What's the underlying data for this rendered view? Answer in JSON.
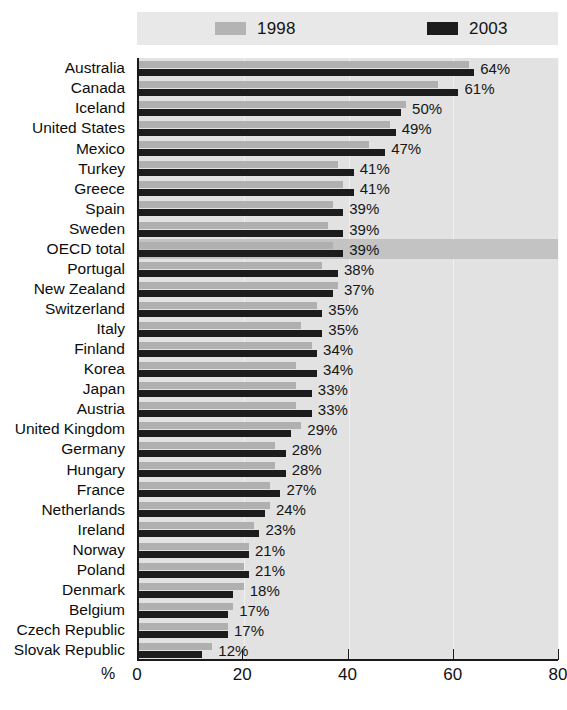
{
  "legend": {
    "entries": [
      {
        "label": "1998",
        "color": "#b0b0b0",
        "swatch": "gray"
      },
      {
        "label": "2003",
        "color": "#1c1c1c",
        "swatch": "black"
      }
    ]
  },
  "axis": {
    "unit": "%",
    "ticks": [
      "0",
      "20",
      "40",
      "60",
      "80"
    ],
    "min": 0,
    "max": 80
  },
  "chart_data": {
    "type": "bar",
    "orientation": "horizontal",
    "title": "",
    "subtitle": "",
    "xlabel": "%",
    "ylabel": "",
    "xlim": [
      0,
      80
    ],
    "grid": true,
    "legend_position": "top",
    "highlight_category": "OECD total",
    "categories": [
      "Australia",
      "Canada",
      "Iceland",
      "United States",
      "Mexico",
      "Turkey",
      "Greece",
      "Spain",
      "Sweden",
      "OECD total",
      "Portugal",
      "New Zealand",
      "Switzerland",
      "Italy",
      "Finland",
      "Korea",
      "Japan",
      "Austria",
      "United Kingdom",
      "Germany",
      "Hungary",
      "France",
      "Netherlands",
      "Ireland",
      "Norway",
      "Poland",
      "Denmark",
      "Belgium",
      "Czech Republic",
      "Slovak Republic"
    ],
    "series": [
      {
        "name": "1998",
        "color": "#b0b0b0",
        "values": [
          63,
          57,
          51,
          48,
          44,
          38,
          39,
          37,
          36,
          37,
          35,
          38,
          34,
          31,
          33,
          30,
          30,
          30,
          31,
          26,
          26,
          25,
          25,
          22,
          21,
          20,
          20,
          18,
          17,
          14
        ]
      },
      {
        "name": "2003",
        "color": "#1c1c1c",
        "values": [
          64,
          61,
          50,
          49,
          47,
          41,
          41,
          39,
          39,
          39,
          38,
          37,
          35,
          35,
          34,
          34,
          33,
          33,
          29,
          28,
          28,
          27,
          24,
          23,
          21,
          21,
          18,
          17,
          17,
          12
        ]
      }
    ],
    "data_labels": [
      "64%",
      "61%",
      "50%",
      "49%",
      "47%",
      "41%",
      "41%",
      "39%",
      "39%",
      "39%",
      "38%",
      "37%",
      "35%",
      "35%",
      "34%",
      "34%",
      "33%",
      "33%",
      "29%",
      "28%",
      "28%",
      "27%",
      "24%",
      "23%",
      "21%",
      "21%",
      "18%",
      "17%",
      "17%",
      "12%"
    ]
  }
}
